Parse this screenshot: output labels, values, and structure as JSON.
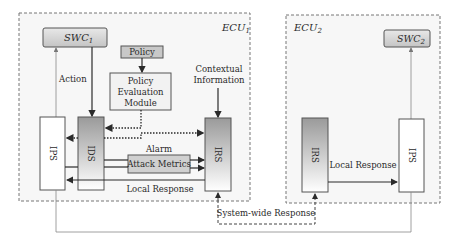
{
  "ecu1": {
    "label": "ECU",
    "sub": "1",
    "swc": {
      "label": "SWC",
      "sub": "1"
    },
    "policy": "Policy",
    "pem": [
      "Policy",
      "Evaluation",
      "Module"
    ],
    "contextual": [
      "Contextual",
      "Information"
    ],
    "action": "Action",
    "ips": "IPS",
    "ids": "IDS",
    "irs": "IRS",
    "alarm": "Alarm",
    "attack_metrics": "Attack Metrics",
    "local_response": "Local Response"
  },
  "ecu2": {
    "label": "ECU",
    "sub": "2",
    "swc": {
      "label": "SWC",
      "sub": "2"
    },
    "irs": "IRS",
    "ips": "IPS",
    "local_response": "Local Response"
  },
  "system_wide_response": "System-wide Response",
  "colors": {
    "ecu_border": "#777777",
    "ecu_fill": "#f7f7f7",
    "swc_fill": "#d0d0d0",
    "policy_fill": "#c8c8c8",
    "attack_fill": "#d0d0d0",
    "gradient_top": "#9a9a9a",
    "gradient_bottom": "#ffffff",
    "arrow": "#2a2a2a",
    "thin_line": "#888888"
  }
}
